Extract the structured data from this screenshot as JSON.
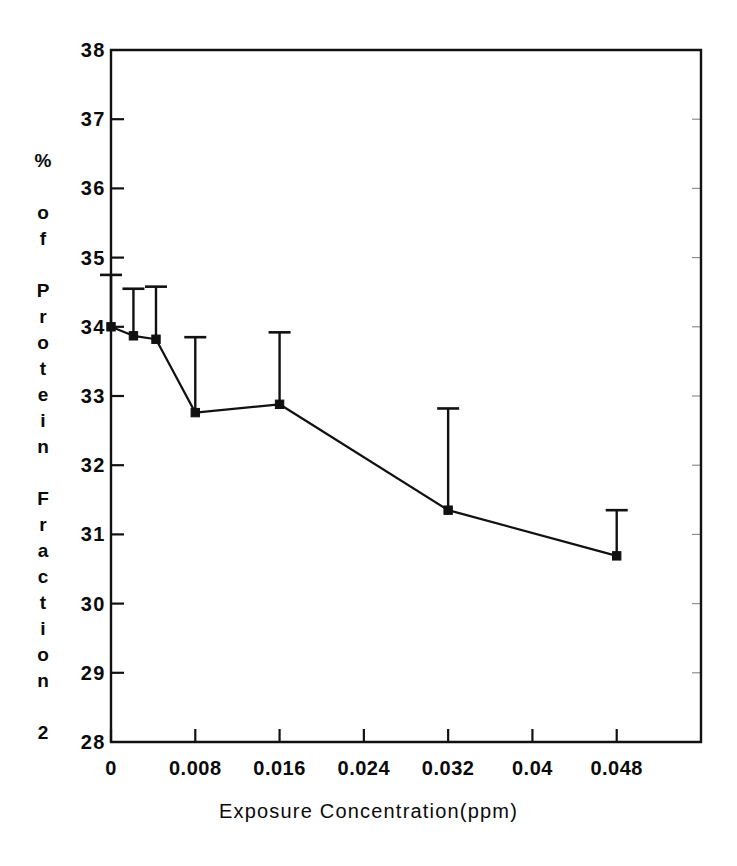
{
  "chart_data": {
    "type": "line",
    "title": "",
    "xlabel": "Exposure Concentration(ppm)",
    "ylabel": "% of Protein Fraction 2",
    "ylabel_letters": [
      "%",
      "",
      "o",
      "f",
      "",
      "P",
      "r",
      "o",
      "t",
      "e",
      "i",
      "n",
      "",
      "F",
      "r",
      "a",
      "c",
      "t",
      "i",
      "o",
      "n",
      "",
      "2"
    ],
    "xlim": [
      0,
      0.056
    ],
    "ylim": [
      28,
      38
    ],
    "xticks": [
      0,
      0.008,
      0.016,
      0.024,
      0.032,
      0.04,
      0.048
    ],
    "xticklabels": [
      "0",
      "0.008",
      "0.016",
      "0.024",
      "0.032",
      "0.04",
      "0.048"
    ],
    "yticks": [
      28,
      29,
      30,
      31,
      32,
      33,
      34,
      35,
      36,
      37,
      38
    ],
    "yticklabels": [
      "28",
      "29",
      "30",
      "31",
      "32",
      "33",
      "34",
      "35",
      "36",
      "37",
      "38"
    ],
    "grid": false,
    "legend": false,
    "marker": "filled-square",
    "errorbar_direction": "upper-only",
    "x": [
      0,
      0.00213,
      0.00427,
      0.008,
      0.016,
      0.032,
      0.048
    ],
    "values": [
      34.0,
      33.87,
      33.82,
      32.76,
      32.88,
      31.35,
      30.69
    ],
    "error_upper": [
      34.75,
      34.55,
      34.58,
      33.85,
      33.92,
      32.82,
      31.35
    ],
    "series": [
      {
        "name": "Protein Fraction 2",
        "points": [
          {
            "x": 0,
            "y": 34.0,
            "err_top": 34.75
          },
          {
            "x": 0.00213,
            "y": 33.87,
            "err_top": 34.55
          },
          {
            "x": 0.00427,
            "y": 33.82,
            "err_top": 34.58
          },
          {
            "x": 0.008,
            "y": 32.76,
            "err_top": 33.85
          },
          {
            "x": 0.016,
            "y": 32.88,
            "err_top": 33.92
          },
          {
            "x": 0.032,
            "y": 31.35,
            "err_top": 32.82
          },
          {
            "x": 0.048,
            "y": 30.69,
            "err_top": 31.35
          }
        ]
      }
    ],
    "colors": {
      "line": "#111111",
      "marker": "#111111",
      "errorbar": "#111111",
      "axis": "#111111",
      "background": "#ffffff"
    }
  }
}
